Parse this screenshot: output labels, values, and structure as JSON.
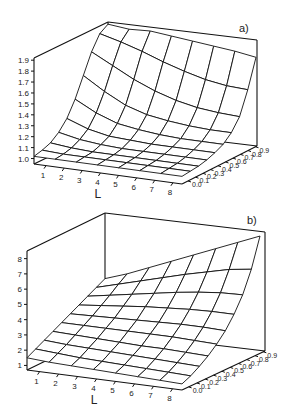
{
  "chart_data": [
    {
      "type": "surface3d",
      "panel_label": "a)",
      "xlabel": "L",
      "ylabel": "",
      "zlabel": "",
      "x_ticks": [
        "1",
        "2",
        "3",
        "4",
        "5",
        "6",
        "7",
        "8"
      ],
      "y_ticks": [
        "0.0",
        "0.1",
        "0.2",
        "0.3",
        "0.4",
        "0.5",
        "0.6",
        "0.7",
        "0.8",
        "0.9"
      ],
      "z_ticks": [
        "1.0",
        "1.1",
        "1.2",
        "1.3",
        "1.4",
        "1.5",
        "1.6",
        "1.7",
        "1.8",
        "1.9"
      ],
      "zlim": [
        1.0,
        1.9
      ],
      "grid": false,
      "geometry": {
        "fl": [
          34,
          164
        ],
        "fr": [
          182,
          184
        ],
        "br": [
          257,
          146
        ],
        "bl": [
          108,
          128
        ],
        "ztop_front": 58,
        "zbot_front": 164,
        "zmin": 0.95,
        "zmax": 1.92
      },
      "x": [
        1,
        2,
        3,
        4,
        5,
        6,
        7,
        8
      ],
      "y": [
        0.0,
        0.1,
        0.2,
        0.3,
        0.4,
        0.5,
        0.6,
        0.7,
        0.8,
        0.9
      ],
      "z": [
        [
          1.02,
          1.02,
          1.02,
          1.02,
          1.02,
          1.02,
          1.02,
          1.02
        ],
        [
          1.04,
          1.03,
          1.03,
          1.03,
          1.03,
          1.03,
          1.03,
          1.03
        ],
        [
          1.07,
          1.05,
          1.04,
          1.04,
          1.04,
          1.04,
          1.04,
          1.04
        ],
        [
          1.13,
          1.09,
          1.07,
          1.06,
          1.06,
          1.06,
          1.06,
          1.06
        ],
        [
          1.22,
          1.15,
          1.11,
          1.1,
          1.09,
          1.09,
          1.09,
          1.09
        ],
        [
          1.36,
          1.26,
          1.19,
          1.16,
          1.14,
          1.13,
          1.13,
          1.13
        ],
        [
          1.54,
          1.42,
          1.32,
          1.26,
          1.23,
          1.21,
          1.2,
          1.2
        ],
        [
          1.72,
          1.62,
          1.52,
          1.44,
          1.38,
          1.34,
          1.32,
          1.31
        ],
        [
          1.85,
          1.8,
          1.74,
          1.67,
          1.61,
          1.56,
          1.53,
          1.52
        ],
        [
          1.9,
          1.88,
          1.89,
          1.87,
          1.85,
          1.83,
          1.81,
          1.78
        ]
      ]
    },
    {
      "type": "surface3d",
      "panel_label": "b)",
      "xlabel": "L",
      "ylabel": "",
      "zlabel": "",
      "x_ticks": [
        "1",
        "2",
        "3",
        "4",
        "5",
        "6",
        "7",
        "8"
      ],
      "y_ticks": [
        "0.0",
        "0.1",
        "0.2",
        "0.3",
        "0.4",
        "0.5",
        "0.6",
        "0.7",
        "0.8",
        "0.9"
      ],
      "z_ticks": [
        "1",
        "2",
        "3",
        "4",
        "5",
        "6",
        "7",
        "8"
      ],
      "zlim": [
        1,
        8
      ],
      "grid": false,
      "geometry": {
        "fl": [
          27,
          165
        ],
        "fr": [
          182,
          185
        ],
        "br": [
          265,
          146
        ],
        "bl": [
          105,
          127
        ],
        "ztop_front": 46,
        "zbot_front": 165,
        "zmin": 0.7,
        "zmax": 8.5
      },
      "x": [
        1,
        2,
        3,
        4,
        5,
        6,
        7,
        8
      ],
      "y": [
        0.0,
        0.1,
        0.2,
        0.3,
        0.4,
        0.5,
        0.6,
        0.7,
        0.8,
        0.9
      ],
      "z": [
        [
          1.5,
          1.4,
          1.35,
          1.3,
          1.25,
          1.2,
          1.15,
          1.1
        ],
        [
          1.8,
          1.7,
          1.6,
          1.55,
          1.5,
          1.45,
          1.4,
          1.35
        ],
        [
          2.1,
          2.0,
          1.95,
          1.9,
          1.85,
          1.8,
          1.75,
          1.7
        ],
        [
          2.4,
          2.35,
          2.3,
          2.25,
          2.2,
          2.2,
          2.15,
          2.1
        ],
        [
          2.7,
          2.7,
          2.7,
          2.7,
          2.7,
          2.7,
          2.65,
          2.6
        ],
        [
          3.0,
          3.05,
          3.1,
          3.15,
          3.2,
          3.25,
          3.25,
          3.2
        ],
        [
          3.3,
          3.45,
          3.6,
          3.75,
          3.85,
          3.95,
          4.0,
          4.0
        ],
        [
          3.6,
          3.85,
          4.1,
          4.35,
          4.6,
          4.8,
          4.95,
          5.0
        ],
        [
          3.9,
          4.3,
          4.7,
          5.1,
          5.5,
          5.85,
          6.2,
          6.4
        ],
        [
          4.2,
          4.7,
          5.3,
          5.9,
          6.5,
          7.1,
          7.7,
          8.3
        ]
      ]
    }
  ]
}
